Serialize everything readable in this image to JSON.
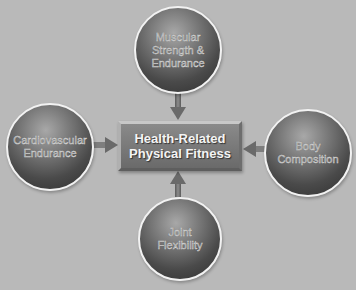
{
  "diagram": {
    "center": {
      "label": "Health-Related\nPhysical Fitness"
    },
    "nodes": [
      {
        "id": "top",
        "label": "Muscular\nStrength &\nEndurance"
      },
      {
        "id": "left",
        "label": "Cardiovascular\nEndurance"
      },
      {
        "id": "right",
        "label": "Body\nComposition"
      },
      {
        "id": "bottom",
        "label": "Joint\nFlexibility"
      }
    ],
    "edges": [
      {
        "from": "top",
        "to": "center"
      },
      {
        "from": "left",
        "to": "center"
      },
      {
        "from": "right",
        "to": "center"
      },
      {
        "from": "bottom",
        "to": "center"
      }
    ],
    "colors": {
      "background": "#b9b9b9",
      "sphere": "#4a4a4a",
      "box": "#7a7a7a",
      "arrow": "#6e6e6e"
    }
  }
}
